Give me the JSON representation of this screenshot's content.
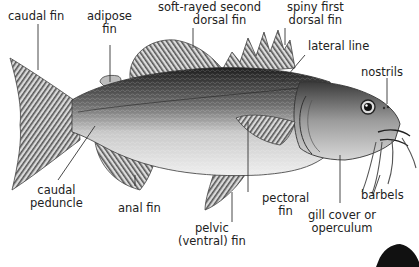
{
  "diagram": {
    "labels": {
      "caudal_fin": "caudal fin",
      "adipose_fin_1": "adipose",
      "adipose_fin_2": "fin",
      "soft_dorsal_1": "soft-rayed second",
      "soft_dorsal_2": "dorsal fin",
      "spiny_dorsal_1": "spiny first",
      "spiny_dorsal_2": "dorsal fin",
      "lateral_line": "lateral line",
      "nostrils": "nostrils",
      "barbels": "barbels",
      "gill_cover_1": "gill cover or",
      "gill_cover_2": "operculum",
      "pectoral_fin_1": "pectoral",
      "pectoral_fin_2": "fin",
      "pelvic_fin_1": "pelvic",
      "pelvic_fin_2": "(ventral) fin",
      "anal_fin": "anal fin",
      "caudal_peduncle_1": "caudal",
      "caudal_peduncle_2": "peduncle"
    },
    "colors": {
      "text": "#222222",
      "leader": "#333333",
      "body_dark": "#2a2a2a",
      "body_mid": "#8a8a8a",
      "belly": "#e8e8e8",
      "fin": "#9a9a9a"
    }
  }
}
